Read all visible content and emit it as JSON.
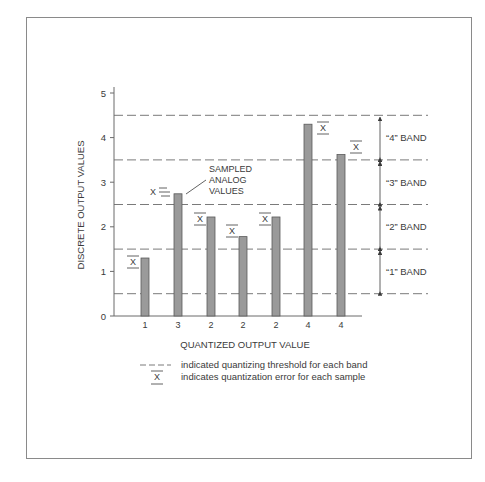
{
  "chart_data": {
    "type": "bar",
    "title": "",
    "xlabel": "QUANTIZED OUTPUT VALUE",
    "ylabel": "DISCRETE OUTPUT VALUES",
    "ylim": [
      0,
      5
    ],
    "yticks": [
      0,
      1,
      2,
      3,
      4,
      5
    ],
    "grid": false,
    "categories": [
      "1",
      "3",
      "2",
      "2",
      "2",
      "4",
      "4"
    ],
    "values": [
      1.3,
      2.74,
      2.22,
      1.78,
      2.22,
      4.3,
      3.62
    ],
    "thresholds": [
      0.5,
      1.5,
      2.5,
      3.5,
      4.5
    ],
    "bands": [
      {
        "label": "“1” BAND",
        "from": 0.5,
        "to": 1.5
      },
      {
        "label": "“2” BAND",
        "from": 1.5,
        "to": 2.5
      },
      {
        "label": "“3” BAND",
        "from": 2.5,
        "to": 3.5
      },
      {
        "label": "“4” BAND",
        "from": 3.5,
        "to": 4.5
      }
    ],
    "annotations": {
      "sampled_label": [
        "SAMPLED",
        "ANALOG",
        "VALUES"
      ],
      "error_symbol": "X"
    },
    "legend": [
      {
        "symbol": "dashed-line",
        "text": "indicated quantizing threshold for each band"
      },
      {
        "symbol": "x-bar",
        "text": "indicates quantization error for each sample"
      }
    ]
  },
  "colors": {
    "bar_fill": "#9a9a9a",
    "bar_stroke": "#5a5a5a",
    "axis": "#6a6a6a",
    "dashed": "#7a7a7a",
    "text": "#3a3a3a",
    "frame": "#8a8a8a"
  }
}
